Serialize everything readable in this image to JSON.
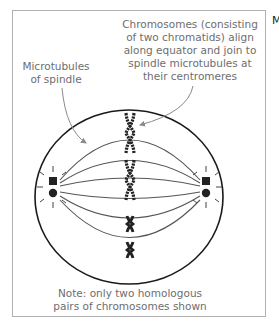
{
  "figure": {
    "labels": {
      "chromosomes": [
        "Chromosomes (consisting",
        "of two chromatids) align",
        "along equator and join to",
        "spindle microtubules at",
        "their centromeres"
      ],
      "microtubules": [
        "Microtubules",
        "of spindle"
      ],
      "note": [
        "Note: only two homologous",
        "pairs of chromosomes shown"
      ]
    },
    "cutoff_text": "M",
    "colors": {
      "frame": "#b0b0b0",
      "label_text": "#6e6e6e",
      "cell_outline": "#1a1a1a",
      "spindle": "#555555",
      "chromosome": "#222222",
      "arrow": "#8a8a8a"
    },
    "icons": {
      "centrosome_left": "square-and-dot",
      "centrosome_right": "square-and-dot",
      "chromosomes": [
        "large-x",
        "large-x",
        "small-x",
        "small-x"
      ]
    }
  }
}
